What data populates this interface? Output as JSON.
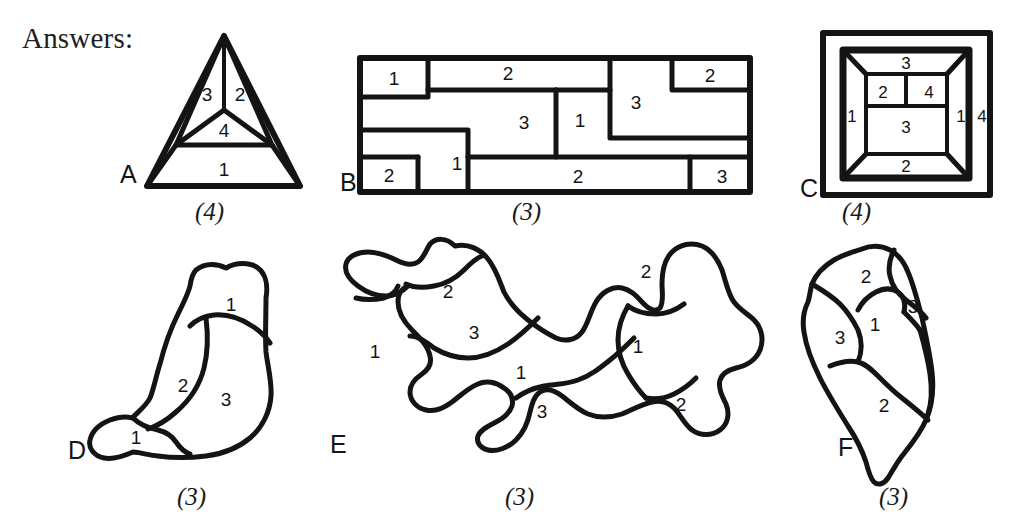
{
  "page": {
    "title": "Answers:",
    "background": "#ffffff",
    "ink": "#141414",
    "width": 1018,
    "height": 532
  },
  "figures": [
    {
      "id": "A",
      "letter": "A",
      "count": "(4)",
      "shape": "triangle-subdivided",
      "regions": [
        {
          "label": "3",
          "x": 207,
          "y": 95
        },
        {
          "label": "2",
          "x": 240,
          "y": 95
        },
        {
          "label": "4",
          "x": 224,
          "y": 131
        },
        {
          "label": "1",
          "x": 224,
          "y": 170
        }
      ],
      "letter_pos": {
        "x": 120,
        "y": 160
      },
      "count_pos": {
        "x": 195,
        "y": 198
      }
    },
    {
      "id": "B",
      "letter": "B",
      "count": "(3)",
      "shape": "rectangle-partition",
      "regions": [
        {
          "label": "1",
          "x": 394,
          "y": 83
        },
        {
          "label": "2",
          "x": 508,
          "y": 74
        },
        {
          "label": "3",
          "x": 524,
          "y": 123
        },
        {
          "label": "1",
          "x": 580,
          "y": 121
        },
        {
          "label": "3",
          "x": 636,
          "y": 103
        },
        {
          "label": "2",
          "x": 707,
          "y": 84
        },
        {
          "label": "2",
          "x": 395,
          "y": 178
        },
        {
          "label": "1",
          "x": 459,
          "y": 165
        },
        {
          "label": "2",
          "x": 578,
          "y": 179
        },
        {
          "label": "3",
          "x": 723,
          "y": 179
        }
      ],
      "letter_pos": {
        "x": 340,
        "y": 168
      },
      "count_pos": {
        "x": 512,
        "y": 198
      }
    },
    {
      "id": "C",
      "letter": "C",
      "count": "(4)",
      "shape": "nested-square-frustum",
      "regions": [
        {
          "label": "3",
          "x": 906,
          "y": 62
        },
        {
          "label": "2",
          "x": 882,
          "y": 93
        },
        {
          "label": "4",
          "x": 929,
          "y": 93
        },
        {
          "label": "1",
          "x": 851,
          "y": 115
        },
        {
          "label": "3",
          "x": 906,
          "y": 127
        },
        {
          "label": "1",
          "x": 963,
          "y": 114
        },
        {
          "label": "4",
          "x": 986,
          "y": 114
        },
        {
          "label": "2",
          "x": 906,
          "y": 168
        }
      ],
      "letter_pos": {
        "x": 800,
        "y": 174
      },
      "count_pos": {
        "x": 842,
        "y": 198
      }
    },
    {
      "id": "D",
      "letter": "D",
      "count": "(3)",
      "shape": "blob-3-regions",
      "regions": [
        {
          "label": "1",
          "x": 231,
          "y": 293
        },
        {
          "label": "2",
          "x": 182,
          "y": 386
        },
        {
          "label": "3",
          "x": 222,
          "y": 400
        },
        {
          "label": "1",
          "x": 135,
          "y": 442
        }
      ],
      "letter_pos": {
        "x": 68,
        "y": 455
      },
      "count_pos": {
        "x": 177,
        "y": 500
      }
    },
    {
      "id": "E",
      "letter": "E",
      "count": "(3)",
      "shape": "blob-amoeba",
      "regions": [
        {
          "label": "2",
          "x": 448,
          "y": 292
        },
        {
          "label": "3",
          "x": 473,
          "y": 332
        },
        {
          "label": "1",
          "x": 375,
          "y": 350
        },
        {
          "label": "1",
          "x": 520,
          "y": 374
        },
        {
          "label": "3",
          "x": 541,
          "y": 412
        },
        {
          "label": "2",
          "x": 644,
          "y": 272
        },
        {
          "label": "1",
          "x": 638,
          "y": 345
        },
        {
          "label": "2",
          "x": 679,
          "y": 405
        }
      ],
      "letter_pos": {
        "x": 330,
        "y": 448
      },
      "count_pos": {
        "x": 505,
        "y": 500
      }
    },
    {
      "id": "F",
      "letter": "F",
      "count": "(3)",
      "shape": "blob-leaf",
      "regions": [
        {
          "label": "2",
          "x": 866,
          "y": 276
        },
        {
          "label": "3",
          "x": 914,
          "y": 306
        },
        {
          "label": "1",
          "x": 874,
          "y": 325
        },
        {
          "label": "3",
          "x": 840,
          "y": 338
        },
        {
          "label": "2",
          "x": 884,
          "y": 405
        }
      ],
      "letter_pos": {
        "x": 838,
        "y": 450
      },
      "count_pos": {
        "x": 879,
        "y": 500
      }
    }
  ]
}
